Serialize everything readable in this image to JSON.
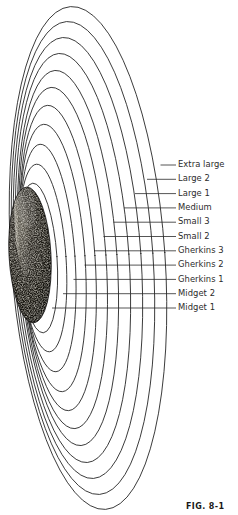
{
  "figure": {
    "caption": "FIG.  8-1",
    "subject_icon": "pickle-photo",
    "description_icon": "concentric-oval-grading-chart"
  },
  "colors": {
    "background": "#ffffff",
    "curve_stroke": "#1f1f1f",
    "leader_stroke": "#2a2a2a",
    "label_text": "#2b2b2b",
    "caption_text": "#1a1a1a",
    "pickle_dark": "#141210",
    "pickle_light": "#d8d4c8"
  },
  "size_labels": [
    {
      "label": "Extra large",
      "y": 160,
      "leader_y": 165.0,
      "leader_start_x": 160.5
    },
    {
      "label": "Large 2",
      "y": 174,
      "leader_y": 179.3,
      "leader_start_x": 147.0
    },
    {
      "label": "Large 1",
      "y": 189,
      "leader_y": 193.6,
      "leader_start_x": 135.0
    },
    {
      "label": "Medium",
      "y": 203,
      "leader_y": 207.9,
      "leader_start_x": 124.0
    },
    {
      "label": "Small 3",
      "y": 217,
      "leader_y": 222.2,
      "leader_start_x": 113.5
    },
    {
      "label": "Small 2",
      "y": 232,
      "leader_y": 236.5,
      "leader_start_x": 103.5
    },
    {
      "label": "Gherkins 3",
      "y": 246,
      "leader_y": 250.8,
      "leader_start_x": 94.0
    },
    {
      "label": "Gherkins 2",
      "y": 260,
      "leader_y": 265.1,
      "leader_start_x": 84.5
    },
    {
      "label": "Gherkins 1",
      "y": 275,
      "leader_y": 279.4,
      "leader_start_x": 73.5
    },
    {
      "label": "Midget 2",
      "y": 289,
      "leader_y": 293.7,
      "leader_start_x": 63.0
    },
    {
      "label": "Midget 1",
      "y": 303,
      "leader_y": 308.0,
      "leader_start_x": 52.0
    }
  ],
  "leader_end_x": 176,
  "ovals": [
    {
      "index": 1,
      "cx": 88,
      "cy": 258,
      "rx": 77,
      "ry": 252,
      "rotate": -4
    },
    {
      "index": 2,
      "cx": 83,
      "cy": 258,
      "rx": 70,
      "ry": 237,
      "rotate": -4
    },
    {
      "index": 3,
      "cx": 78,
      "cy": 258,
      "rx": 63,
      "ry": 221,
      "rotate": -4
    },
    {
      "index": 4,
      "cx": 73,
      "cy": 258,
      "rx": 56,
      "ry": 205,
      "rotate": -4
    },
    {
      "index": 5,
      "cx": 68,
      "cy": 258,
      "rx": 49,
      "ry": 188,
      "rotate": -4
    },
    {
      "index": 6,
      "cx": 63,
      "cy": 258,
      "rx": 43,
      "ry": 171,
      "rotate": -4
    },
    {
      "index": 7,
      "cx": 58,
      "cy": 258,
      "rx": 37,
      "ry": 153,
      "rotate": -4
    },
    {
      "index": 8,
      "cx": 53,
      "cy": 258,
      "rx": 32,
      "ry": 134,
      "rotate": -4
    },
    {
      "index": 9,
      "cx": 48,
      "cy": 258,
      "rx": 27,
      "ry": 114,
      "rotate": -4
    },
    {
      "index": 10,
      "cx": 43,
      "cy": 258,
      "rx": 23,
      "ry": 94,
      "rotate": -4
    },
    {
      "index": 11,
      "cx": 38,
      "cy": 258,
      "rx": 19,
      "ry": 75,
      "rotate": -4
    }
  ],
  "pickle": {
    "cx": 30,
    "cy": 255,
    "rx": 21,
    "ry": 68,
    "rotate": -3
  }
}
